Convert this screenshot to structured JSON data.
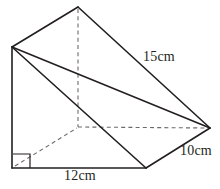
{
  "figure": {
    "kind": "triangular-prism",
    "colors": {
      "visible_edge": "#231f20",
      "hidden_edge": "#6d6a6b",
      "background": "#ffffff"
    }
  },
  "labels": {
    "slant_edge": "15cm",
    "depth_edge": "10cm",
    "base_edge": "12cm",
    "height_edge": "m"
  },
  "annotations": {
    "right_angle_marker": "right-angle"
  },
  "geometry": {
    "vertices": {
      "back_apex": [
        78,
        7
      ],
      "front_apex": [
        12,
        47
      ],
      "back_bottom_left": [
        78,
        127
      ],
      "back_bottom_right": [
        210,
        128
      ],
      "front_bottom_left": [
        12,
        168
      ],
      "front_bottom_right": [
        146,
        168
      ]
    },
    "visible_edges": [
      "front_apex-back_apex",
      "back_apex-back_bottom_right",
      "front_apex-front_bottom_left",
      "front_apex-front_bottom_right",
      "front_bottom_left-front_bottom_right",
      "front_bottom_right-back_bottom_right",
      "front_apex-back_bottom_right"
    ],
    "hidden_edges": [
      "back_apex-back_bottom_left",
      "back_bottom_left-back_bottom_right",
      "back_bottom_left-front_bottom_left"
    ]
  }
}
